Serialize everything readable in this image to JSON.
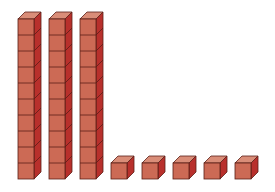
{
  "diagram": {
    "colors": {
      "front": "#cc6a55",
      "top": "#d98d78",
      "side": "#b8302c",
      "stroke": "#5a1e16",
      "background": "#ffffff"
    },
    "tens_rods": [
      {
        "x": 18,
        "units": 10
      },
      {
        "x": 49,
        "units": 10
      },
      {
        "x": 80,
        "units": 10
      }
    ],
    "unit_cubes": [
      {
        "x": 111
      },
      {
        "x": 142
      },
      {
        "x": 173
      },
      {
        "x": 204
      },
      {
        "x": 235
      }
    ],
    "geometry": {
      "cube_size": 16,
      "depth": 7,
      "baseline_y": 179
    }
  }
}
